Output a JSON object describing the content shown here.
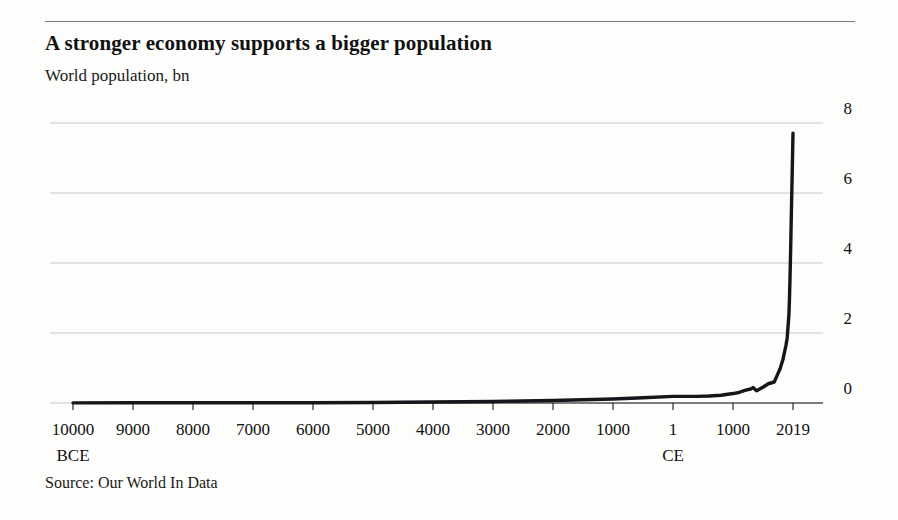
{
  "header": {
    "title": "A stronger economy supports a bigger population",
    "subtitle": "World population, bn"
  },
  "footer": {
    "source": "Source: Our World In Data"
  },
  "colors": {
    "line": "#16161a",
    "gridline": "#c9c9c9",
    "axis": "#16161a",
    "rule": "#7a7a7a",
    "background": "#fdfdfc",
    "text": "#111111"
  },
  "chart_data": {
    "type": "line",
    "title": "A stronger economy supports a bigger population",
    "subtitle": "World population, bn",
    "xlabel": "",
    "ylabel": "World population, bn",
    "grid": true,
    "legend": false,
    "source": "Source: Our World In Data",
    "xtick_labels": [
      "10000",
      "9000",
      "8000",
      "7000",
      "6000",
      "5000",
      "4000",
      "3000",
      "2000",
      "1000",
      "1",
      "1000",
      "2019"
    ],
    "xtick_sublabels": {
      "10000": "BCE",
      "1": "CE"
    },
    "xtick_values": [
      -10000,
      -9000,
      -8000,
      -7000,
      -6000,
      -5000,
      -4000,
      -3000,
      -2000,
      -1000,
      1,
      1000,
      2019
    ],
    "ytick_labels": [
      "0",
      "2",
      "4",
      "6",
      "8"
    ],
    "ytick_values": [
      0,
      2,
      4,
      6,
      8
    ],
    "ylim": [
      0,
      8
    ],
    "xlim": [
      -10000,
      2019
    ],
    "series": [
      {
        "name": "World population",
        "unit": "bn",
        "x": [
          -10000,
          -9000,
          -8000,
          -7000,
          -6000,
          -5000,
          -4000,
          -3000,
          -2000,
          -1000,
          -500,
          1,
          200,
          400,
          600,
          800,
          1000,
          1100,
          1200,
          1300,
          1340,
          1400,
          1500,
          1600,
          1700,
          1750,
          1800,
          1850,
          1900,
          1920,
          1940,
          1950,
          1960,
          1970,
          1980,
          1990,
          2000,
          2010,
          2019
        ],
        "y": [
          0.004,
          0.005,
          0.006,
          0.007,
          0.009,
          0.015,
          0.028,
          0.045,
          0.072,
          0.115,
          0.15,
          0.19,
          0.19,
          0.19,
          0.2,
          0.22,
          0.27,
          0.3,
          0.36,
          0.4,
          0.44,
          0.35,
          0.44,
          0.55,
          0.6,
          0.79,
          0.98,
          1.26,
          1.65,
          1.86,
          2.3,
          2.54,
          3.03,
          3.7,
          4.45,
          5.32,
          6.14,
          6.96,
          7.71
        ]
      }
    ],
    "annotations": [
      {
        "label": "peak value",
        "x": 2019,
        "y": 7.71
      }
    ]
  }
}
